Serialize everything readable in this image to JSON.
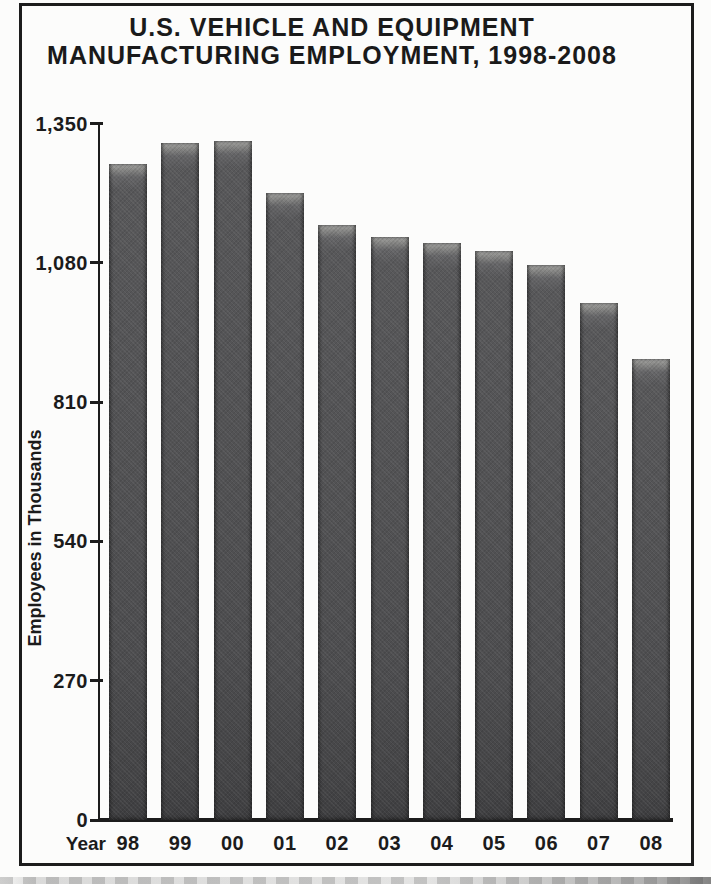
{
  "chart_data": {
    "type": "bar",
    "title": "U.S. VEHICLE AND EQUIPMENT MANUFACTURING EMPLOYMENT, 1998-2008",
    "title_lines": [
      "U.S. VEHICLE AND EQUIPMENT",
      "MANUFACTURING EMPLOYMENT, 1998-2008"
    ],
    "xlabel": "Year",
    "ylabel": "Employees in Thousands",
    "categories": [
      "98",
      "99",
      "00",
      "01",
      "02",
      "03",
      "04",
      "05",
      "06",
      "07",
      "08"
    ],
    "values": [
      1272,
      1313,
      1316,
      1215,
      1153,
      1130,
      1119,
      1103,
      1076,
      1003,
      894
    ],
    "ylim": [
      0,
      1350
    ],
    "ytick_values": [
      0,
      270,
      540,
      810,
      1080,
      1350
    ],
    "ytick_labels": [
      "0",
      "270",
      "540",
      "810",
      "1,080",
      "1,350"
    ],
    "grid": "off",
    "legend": "none",
    "bar_color": "#4f4f51",
    "bar_top_highlight": "#9a9a98",
    "axis_color": "#1c1c1c",
    "frame_border_color": "#1c1c1c",
    "background_color": "#fcfcfb"
  }
}
